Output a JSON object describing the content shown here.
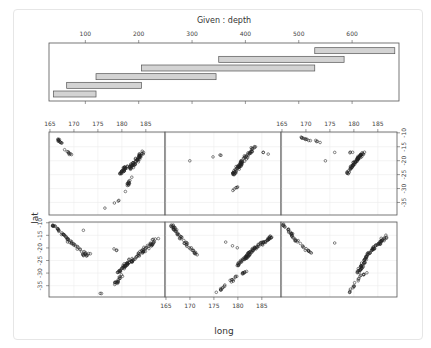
{
  "chart_data": {
    "type": "scatter",
    "subtype": "coplot",
    "title": "Given : depth",
    "xlabel": "long",
    "ylabel": "lat",
    "given": {
      "variable": "depth",
      "ticks": [
        100,
        200,
        300,
        400,
        500,
        600
      ],
      "range": [
        40,
        680
      ],
      "intervals": [
        [
          40,
          120
        ],
        [
          65,
          205
        ],
        [
          120,
          345
        ],
        [
          205,
          530
        ],
        [
          350,
          585
        ],
        [
          530,
          680
        ]
      ]
    },
    "x_ticks": [
      165,
      170,
      175,
      180,
      185
    ],
    "y_ticks": [
      -10,
      -15,
      -20,
      -25,
      -30,
      -35
    ],
    "xlim": [
      165,
      189
    ],
    "ylim": [
      -39,
      -10
    ],
    "grid": true,
    "layout": {
      "rows": 2,
      "cols": 3,
      "panel_order": "bottom-left first, row-wise"
    },
    "panels": [
      {
        "depth_interval": [
          40,
          120
        ],
        "row": 2,
        "col": 1,
        "description": "western arc from (165.5,-11) to (172,-23), eastern band 179-188 long, -14 to -38 lat"
      },
      {
        "depth_interval": [
          65,
          205
        ],
        "row": 2,
        "col": 2,
        "description": "western arc 166-172 long, eastern dense band 176-188 long"
      },
      {
        "depth_interval": [
          120,
          345
        ],
        "row": 2,
        "col": 3,
        "description": "western arc 165-171 long, eastern band 178-188 long"
      },
      {
        "depth_interval": [
          205,
          530
        ],
        "row": 1,
        "col": 1,
        "description": "short western cluster 166-170, eastern cluster 177-186"
      },
      {
        "depth_interval": [
          350,
          585
        ],
        "row": 1,
        "col": 2,
        "description": "cluster 178-186 long, -15 to -32 lat"
      },
      {
        "depth_interval": [
          530,
          680
        ],
        "row": 1,
        "col": 3,
        "description": "few points near 169-174, dense cluster 178-183 long, -17 to -27 lat"
      }
    ]
  },
  "labels": {
    "title": "Given : depth",
    "xlabel": "long",
    "ylabel": "lat",
    "depth_ticks": [
      "100",
      "200",
      "300",
      "400",
      "500",
      "600"
    ],
    "long_ticks": [
      "165",
      "170",
      "175",
      "180",
      "185"
    ],
    "lat_ticks": [
      "-10",
      "-15",
      "-20",
      "-25",
      "-30",
      "-35"
    ]
  },
  "colors": {
    "bar_fill": "#d3d3d3",
    "bar_stroke": "#555555",
    "frame": "#555555",
    "grid": "#ececec",
    "point": "#222222"
  }
}
